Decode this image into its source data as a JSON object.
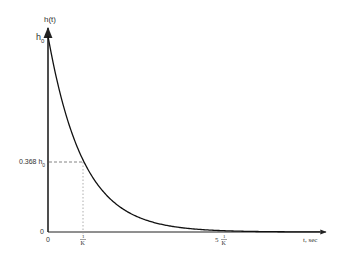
{
  "chart_data": {
    "type": "line",
    "title": "",
    "xlabel": "t, sec",
    "ylabel": "h(t)",
    "function": "h(t) = h0 * exp(-K t)",
    "x": [
      0,
      0.25,
      0.5,
      0.75,
      1,
      1.5,
      2,
      2.5,
      3,
      4,
      5,
      6,
      7
    ],
    "x_units": "1/K (time constants)",
    "values": [
      1.0,
      0.779,
      0.607,
      0.472,
      0.368,
      0.223,
      0.135,
      0.082,
      0.05,
      0.018,
      0.0067,
      0.0025,
      0.0009
    ],
    "y_units": "h0",
    "xlim": [
      0,
      7.9
    ],
    "ylim": [
      0,
      1.0
    ],
    "grid": false,
    "legend": null,
    "y_tick_labels": [
      "h0",
      "0.368 h0",
      "0"
    ],
    "x_tick_labels": [
      "0",
      "1/K",
      "5 1/K"
    ],
    "annotations": [
      {
        "type": "dashed-horizontal",
        "y": 0.368,
        "from_x": 0,
        "to_x": 1,
        "label": "0.368 h0"
      },
      {
        "type": "dotted-vertical",
        "x": 1,
        "from_y": 0,
        "to_y": 0.368,
        "label": "1/K"
      }
    ]
  },
  "axes": {
    "y_label": "h(t)",
    "x_label": "t, sec",
    "y_top_label_main": "h",
    "y_top_label_sub": "0",
    "y_mid_label_main": "0.368 h",
    "y_mid_label_sub": "0",
    "y_zero_label": "0",
    "x_zero_label": "0",
    "tau_num": "1",
    "tau_den": "K",
    "five_tau_coeff": "5",
    "five_tau_num": "1",
    "five_tau_den": "K"
  },
  "colors": {
    "axis": "#222222",
    "curve": "#111111",
    "guide": "#777777",
    "faint_guide": "#bbbbbb"
  }
}
